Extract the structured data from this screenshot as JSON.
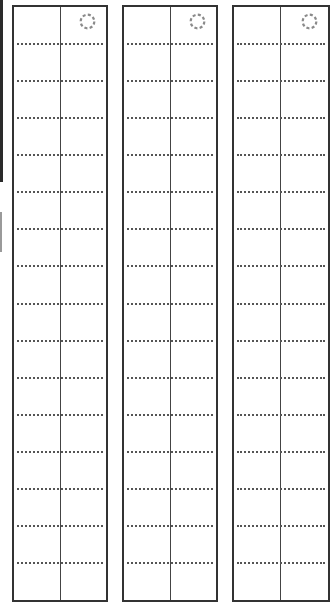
{
  "sheet": {
    "title": "",
    "columns": [
      {
        "id": "column-1",
        "rows": 16,
        "marker": "dashed-circle-icon"
      },
      {
        "id": "column-2",
        "rows": 16,
        "marker": "dashed-circle-icon"
      },
      {
        "id": "column-3",
        "rows": 16,
        "marker": "dashed-circle-icon"
      }
    ],
    "colors": {
      "border": "#333333",
      "divider": "#444444",
      "dotted_rule": "#555555",
      "marker": "#8a8a8a",
      "background": "#ffffff"
    }
  }
}
